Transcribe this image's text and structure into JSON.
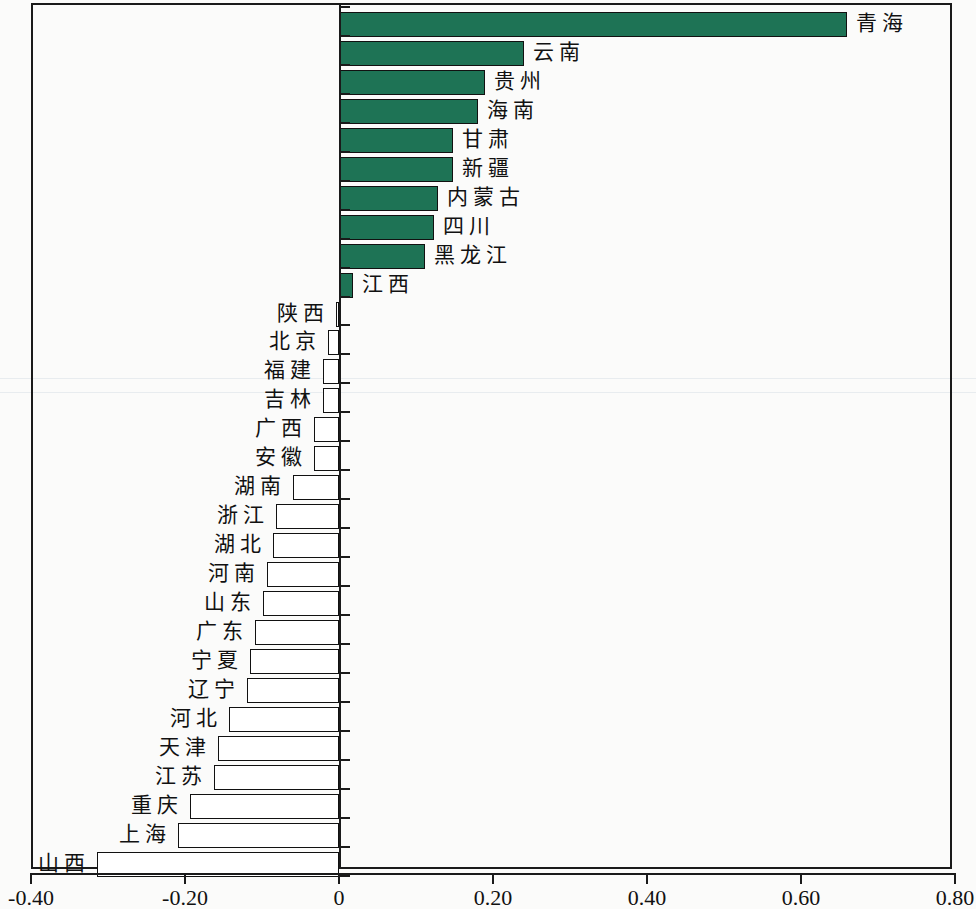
{
  "chart_data": {
    "type": "bar",
    "orientation": "horizontal",
    "title": "",
    "xlabel": "",
    "ylabel": "",
    "xlim": [
      -0.4,
      0.8
    ],
    "grid": false,
    "legend": false,
    "tick_labels": [
      "-0.40",
      "-0.20",
      "0",
      "0.20",
      "0.40",
      "0.60",
      "0.80"
    ],
    "tick_values": [
      -0.4,
      -0.2,
      0,
      0.2,
      0.4,
      0.6,
      0.8
    ],
    "positive_color": "#1e7355",
    "negative_color": "#ffffff",
    "outline_color": "#111111",
    "categories": [
      "青海",
      "云南",
      "贵州",
      "海南",
      "甘肃",
      "新疆",
      "内蒙古",
      "四川",
      "黑龙江",
      "江西",
      "陕西",
      "北京",
      "福建",
      "吉林",
      "广西",
      "安徽",
      "湖南",
      "浙江",
      "湖北",
      "河南",
      "山东",
      "广东",
      "宁夏",
      "辽宁",
      "河北",
      "天津",
      "江苏",
      "重庆",
      "上海",
      "山西"
    ],
    "values": [
      0.66,
      0.24,
      0.19,
      0.18,
      0.148,
      0.148,
      0.129,
      0.123,
      0.112,
      0.018,
      -0.002,
      -0.014,
      -0.021,
      -0.021,
      -0.032,
      -0.032,
      -0.06,
      -0.082,
      -0.086,
      -0.093,
      -0.099,
      -0.109,
      -0.116,
      -0.12,
      -0.143,
      -0.157,
      -0.162,
      -0.194,
      -0.209,
      -0.314
    ]
  },
  "axis": {
    "ticks": [
      {
        "label": "-0.40",
        "value": -0.4
      },
      {
        "label": "-0.20",
        "value": -0.2
      },
      {
        "label": "0",
        "value": 0
      },
      {
        "label": "0.20",
        "value": 0.2
      },
      {
        "label": "0.40",
        "value": 0.4
      },
      {
        "label": "0.60",
        "value": 0.6
      },
      {
        "label": "0.80",
        "value": 0.8
      }
    ]
  }
}
